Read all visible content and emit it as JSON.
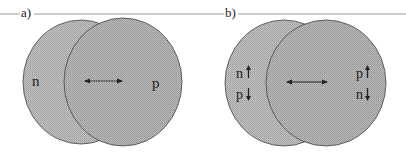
{
  "figure": {
    "panels": [
      {
        "id": "a",
        "label": "a)",
        "left_nucleus": {
          "labels": [
            "n"
          ]
        },
        "right_nucleus": {
          "labels": [
            "p"
          ]
        },
        "arrow": "double-headed horizontal arrow"
      },
      {
        "id": "b",
        "label": "b)",
        "left_nucleus": {
          "labels": [
            "n",
            "p"
          ],
          "spins": [
            "up",
            "down"
          ]
        },
        "right_nucleus": {
          "labels": [
            "p",
            "n"
          ],
          "spins": [
            "up",
            "down"
          ]
        },
        "arrow": "double-headed horizontal arrow"
      }
    ],
    "colors": {
      "circle_fill": "#b8b8b8",
      "circle_fill_front": "#adadad",
      "stroke": "#333333",
      "rule_line": "#999999"
    }
  }
}
